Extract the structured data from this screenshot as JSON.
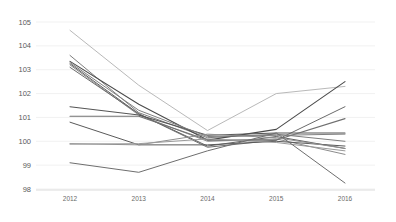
{
  "chart_data": {
    "type": "line",
    "title": "",
    "xlabel": "",
    "ylabel": "",
    "categories": [
      "2012",
      "2013",
      "2014",
      "2015",
      "2016"
    ],
    "x": [
      2012,
      2013,
      2014,
      2015,
      2016
    ],
    "ylim": [
      98,
      105
    ],
    "yticks": [
      98,
      99,
      100,
      101,
      102,
      103,
      104,
      105
    ],
    "ytick_labels": [
      "98",
      "99",
      "100",
      "101",
      "102",
      "103",
      "104",
      "105"
    ],
    "grid": true,
    "legend": "none",
    "series": [
      {
        "name": "Series 1",
        "color": "#b9b9b9",
        "width": 1.0,
        "values": [
          104.65,
          102.35,
          100.45,
          102.0,
          102.3
        ]
      },
      {
        "name": "Series 2",
        "color": "#7e7e7e",
        "width": 1.0,
        "values": [
          103.6,
          101.2,
          100.15,
          100.3,
          100.0
        ]
      },
      {
        "name": "Series 3",
        "color": "#4a4a4a",
        "width": 1.1,
        "values": [
          103.35,
          101.55,
          100.05,
          100.5,
          102.5
        ]
      },
      {
        "name": "Series 4",
        "color": "#5f5f5f",
        "width": 1.0,
        "values": [
          103.25,
          101.15,
          99.8,
          100.2,
          99.7
        ]
      },
      {
        "name": "Series 5",
        "color": "#8c8c8c",
        "width": 1.0,
        "values": [
          103.2,
          101.1,
          100.0,
          100.1,
          99.45
        ]
      },
      {
        "name": "Series 6",
        "color": "#6b6b6b",
        "width": 1.0,
        "values": [
          103.1,
          101.15,
          99.75,
          100.05,
          101.45
        ]
      },
      {
        "name": "Series 7",
        "color": "#555555",
        "width": 1.1,
        "values": [
          101.45,
          101.1,
          100.25,
          100.35,
          100.35
        ]
      },
      {
        "name": "Series 8",
        "color": "#707070",
        "width": 1.1,
        "values": [
          101.05,
          101.05,
          100.05,
          100.05,
          100.95
        ]
      },
      {
        "name": "Series 9",
        "color": "#5a5a5a",
        "width": 1.0,
        "values": [
          100.8,
          99.85,
          99.85,
          100.0,
          99.8
        ]
      },
      {
        "name": "Series 10",
        "color": "#8f8f8f",
        "width": 1.0,
        "values": [
          99.9,
          99.85,
          100.3,
          100.15,
          99.7
        ]
      },
      {
        "name": "Series 11",
        "color": "#9a9a9a",
        "width": 1.0,
        "values": [
          99.88,
          99.9,
          100.1,
          99.95,
          99.6
        ]
      },
      {
        "name": "Series 12",
        "color": "#6e6e6e",
        "width": 1.0,
        "values": [
          99.1,
          98.7,
          99.6,
          100.35,
          98.25
        ]
      },
      {
        "name": "Series 13",
        "color": "#808080",
        "width": 1.0,
        "values": [
          103.3,
          101.3,
          100.2,
          100.25,
          100.3
        ]
      }
    ]
  },
  "axes": {
    "y_axis_name": "index-value",
    "x_axis_name": "year"
  }
}
